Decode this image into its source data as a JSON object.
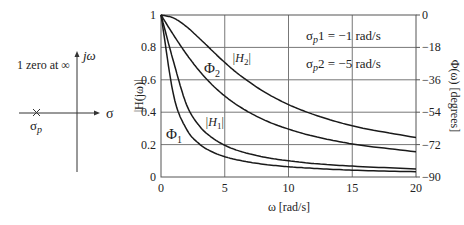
{
  "pole_zero": {
    "zero_label": "1 zero at ∞",
    "jw_label": "jω",
    "sigma_label": "σ",
    "pole_label": "σ",
    "pole_sub": "p"
  },
  "chart_data": {
    "type": "line",
    "title": "",
    "xlabel": "ω  [rad/s]",
    "ylabel": "|H(jω)|",
    "ylabel_right": "Φ(ω)  [degrees]",
    "xlim": [
      0,
      20
    ],
    "ylim": [
      0,
      1
    ],
    "ylim_right": [
      -90,
      0
    ],
    "x_ticks": [
      "0",
      "5",
      "10",
      "15",
      "20"
    ],
    "y_ticks": [
      "0",
      "0.2",
      "0.4",
      "0.6",
      "0.8",
      "1"
    ],
    "y_right_ticks": [
      "−90",
      "−72",
      "−54",
      "−36",
      "−18",
      "0"
    ],
    "grid": true,
    "annotations": [
      {
        "text": "σp1 = −1 rad/s"
      },
      {
        "text": "σp2 = −5 rad/s"
      }
    ],
    "x": [
      0,
      1,
      2,
      3,
      4,
      5,
      6,
      8,
      10,
      12,
      15,
      20
    ],
    "series": [
      {
        "name": "|H1|",
        "axis": "left",
        "values": [
          1.0,
          0.707,
          0.447,
          0.316,
          0.243,
          0.196,
          0.164,
          0.124,
          0.1,
          0.083,
          0.067,
          0.05
        ]
      },
      {
        "name": "Φ1",
        "axis": "right",
        "values": [
          0,
          -45,
          -63.4,
          -71.6,
          -76.0,
          -78.7,
          -80.5,
          -82.9,
          -84.3,
          -85.2,
          -86.2,
          -87.1
        ]
      },
      {
        "name": "|H2|",
        "axis": "left",
        "values": [
          1.0,
          0.981,
          0.928,
          0.857,
          0.781,
          0.707,
          0.64,
          0.53,
          0.447,
          0.385,
          0.316,
          0.243
        ]
      },
      {
        "name": "Φ2",
        "axis": "right",
        "values": [
          0,
          -11.3,
          -21.8,
          -31.0,
          -38.7,
          -45.0,
          -50.2,
          -58.0,
          -63.4,
          -67.4,
          -71.6,
          -76.0
        ]
      }
    ]
  },
  "labels": {
    "phi2": "Φ",
    "phi2_sub": "2",
    "h2": "|H",
    "h2_sub": "2",
    "phi1": "Φ",
    "phi1_sub": "1",
    "h1": "|H",
    "h1_sub": "1",
    "sp1_a": "σ",
    "sp1_b": "p",
    "sp1_c": "1 = −1 rad/s",
    "sp2_a": "σ",
    "sp2_b": "p",
    "sp2_c": "2 = −5 rad/s"
  }
}
